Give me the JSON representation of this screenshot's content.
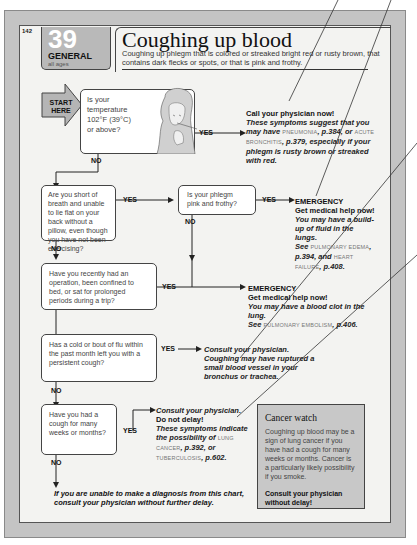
{
  "page": {
    "page_number": "142",
    "chart_number": "39",
    "category": "GENERAL",
    "age_group": "all ages",
    "title": "Coughing up blood",
    "description": "Coughing up phlegm that is colored or streaked bright red or rusty brown, that contains dark flecks or spots, or that is pink and frothy."
  },
  "start": {
    "label_line1": "START",
    "label_line2": "HERE"
  },
  "labels": {
    "yes": "YES",
    "no": "NO"
  },
  "questions": [
    {
      "id": "q1",
      "text": "Is your temperature 102°F (39°C) or above?"
    },
    {
      "id": "q2",
      "text": "Are you short of breath and unable to lie flat on your back without a pillow, even though you have not been exercising?"
    },
    {
      "id": "q3",
      "text": "Is your phlegm pink and frothy?"
    },
    {
      "id": "q4",
      "text": "Have you recently had an operation, been confined to bed, or sat for prolonged periods during a trip?"
    },
    {
      "id": "q5",
      "text": "Has a cold or bout of flu within the past month left you with a persistent cough?"
    },
    {
      "id": "q6",
      "text": "Have you had a cough for many weeks or months?"
    }
  ],
  "outcomes": {
    "a1": {
      "heading": "Call your physician now!",
      "t1": "These symptoms suggest that you may have",
      "sc1": "PNEUMONIA",
      "t2": ", p.384, or",
      "sc2": "ACUTE BRONCHITIS",
      "t3": ", p.379, especially if your phlegm is rusty brown or streaked with red."
    },
    "a3": {
      "heading1": "EMERGENCY",
      "heading2": "Get medical help now!",
      "t1": "You may have a build-up of fluid in the lungs.",
      "t2": "See",
      "sc1": "PULMONARY EDEMA",
      "t3": ", p.394, and",
      "sc2": "HEART FAILURE",
      "t4": ", p.408."
    },
    "a4": {
      "heading1": "EMERGENCY",
      "heading2": "Get medical help now!",
      "t1": "You may have a blood clot in the lung.",
      "t2": "See",
      "sc1": "PULMONARY EMBOLISM",
      "t3": ", p.406."
    },
    "a5": {
      "t1": "Consult your physician. Coughing may have ruptured a small blood vessel in your bronchus or trachea."
    },
    "a6": {
      "t1": "Consult your physician.",
      "heading": "Do not delay!",
      "t2": "These symptoms indicate the possibility of",
      "sc1": "LUNG CANCER",
      "t3": ", p.392, or",
      "sc2": "TUBERCULOSIS",
      "t4": ", p.602."
    },
    "final": {
      "line1": "If you are unable to make a diagnosis from this chart,",
      "line2": "consult your physician without further delay."
    }
  },
  "cancer_watch": {
    "title": "Cancer watch",
    "body": "Coughing up blood may be a sign of lung cancer if you have had a cough for many weeks or months. Cancer is a particularly likely possibility if you smoke.",
    "callout": "Consult your physician without delay!"
  },
  "colors": {
    "frame": "#c4c4c4",
    "panel": "#f3f3f1",
    "badge": "#b9b9b9",
    "box": "#ffffff",
    "cancer_box": "#c8c8c8"
  }
}
